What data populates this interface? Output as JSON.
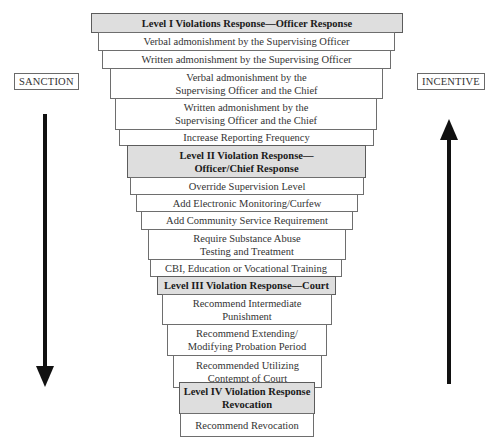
{
  "diagram": {
    "type": "graduated-response-funnel",
    "left_label": "SANCTION",
    "right_label": "INCENTIVE",
    "left_arrow_direction": "down",
    "right_arrow_direction": "up",
    "colors": {
      "level_fill": "#dedede",
      "item_fill": "#ffffff",
      "border": "#6e6e6e",
      "arrow": "#111111"
    },
    "rows": [
      {
        "kind": "level",
        "lines": [
          "Level I Violations Response—Officer Response"
        ]
      },
      {
        "kind": "item",
        "lines": [
          "Verbal admonishment by the Supervising Officer"
        ]
      },
      {
        "kind": "item",
        "lines": [
          "Written admonishment by the Supervising Officer"
        ]
      },
      {
        "kind": "item",
        "lines": [
          "Verbal admonishment by the",
          "Supervising Officer and the Chief"
        ]
      },
      {
        "kind": "item",
        "lines": [
          "Written admonishment by the",
          "Supervising Officer and the Chief"
        ]
      },
      {
        "kind": "item",
        "lines": [
          "Increase Reporting Frequency"
        ]
      },
      {
        "kind": "level",
        "lines": [
          "Level II Violation Response—",
          "Officer/Chief Response"
        ]
      },
      {
        "kind": "item",
        "lines": [
          "Override Supervision Level"
        ]
      },
      {
        "kind": "item",
        "lines": [
          "Add Electronic Monitoring/Curfew"
        ]
      },
      {
        "kind": "item",
        "lines": [
          "Add Community Service Requirement"
        ]
      },
      {
        "kind": "item",
        "lines": [
          "Require Substance Abuse",
          "Testing and Treatment"
        ]
      },
      {
        "kind": "item",
        "lines": [
          "CBI, Education or Vocational Training"
        ]
      },
      {
        "kind": "level",
        "lines": [
          "Level III Violation Response—Court"
        ]
      },
      {
        "kind": "item",
        "lines": [
          "Recommend Intermediate",
          "Punishment"
        ]
      },
      {
        "kind": "item",
        "lines": [
          "Recommend Extending/",
          "Modifying Probation Period"
        ]
      },
      {
        "kind": "item",
        "lines": [
          "Recommended Utilizing",
          "Contempt  of Court"
        ]
      },
      {
        "kind": "level",
        "lines": [
          "Level IV Violation Response",
          "Revocation"
        ]
      },
      {
        "kind": "item",
        "lines": [
          "Recommend Revocation"
        ]
      }
    ]
  }
}
